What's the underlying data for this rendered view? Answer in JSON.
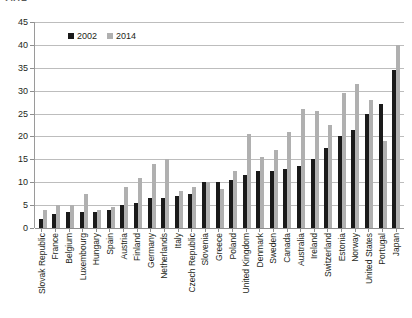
{
  "top_fragment": "2014",
  "legend": {
    "items": [
      {
        "label": "2002",
        "color": "#1a1a1a"
      },
      {
        "label": "2014",
        "color": "#b0b0b0"
      }
    ]
  },
  "chart_data": {
    "type": "bar",
    "title": "",
    "subtitle": "",
    "xlabel": "",
    "ylabel": "",
    "ylim": [
      0,
      45
    ],
    "ytick_step": 5,
    "yticks": [
      0,
      5,
      10,
      15,
      20,
      25,
      30,
      35,
      40,
      45
    ],
    "grid": true,
    "legend_position": "top-left-inside",
    "categories": [
      "Slovak Republic",
      "France",
      "Belgium",
      "Luxembourg",
      "Hungary",
      "Spain",
      "Austria",
      "Finland",
      "Germany",
      "Netherlands",
      "Italy",
      "Czech Republic",
      "Slovenia",
      "Greece",
      "Poland",
      "United Kingdom",
      "Denmark",
      "Sweden",
      "Canada",
      "Australia",
      "Ireland",
      "Switzerland",
      "Estonia",
      "Norway",
      "United States",
      "Portugal",
      "Japan"
    ],
    "series": [
      {
        "name": "2002",
        "color": "#1a1a1a",
        "values": [
          2.0,
          3.0,
          3.5,
          3.5,
          3.5,
          4.0,
          5.0,
          5.5,
          6.5,
          6.5,
          7.0,
          7.5,
          10.0,
          10.0,
          10.5,
          11.5,
          12.5,
          12.5,
          13.0,
          13.5,
          15.0,
          17.5,
          20.0,
          21.5,
          25.0,
          27.0,
          34.5
        ]
      },
      {
        "name": "2014",
        "color": "#b0b0b0",
        "values": [
          4.0,
          5.0,
          5.0,
          7.5,
          4.0,
          4.5,
          9.0,
          11.0,
          14.0,
          15.0,
          8.0,
          9.0,
          10.0,
          8.5,
          12.5,
          20.5,
          15.5,
          17.0,
          21.0,
          26.0,
          25.5,
          22.5,
          29.5,
          31.5,
          28.0,
          19.0,
          40.0
        ]
      }
    ]
  }
}
